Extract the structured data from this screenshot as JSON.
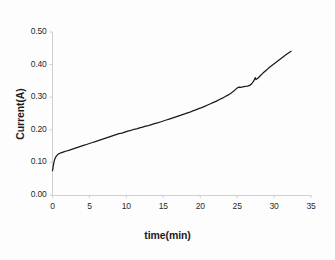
{
  "chart_data": {
    "type": "line",
    "title": "",
    "xlabel": "time(min)",
    "ylabel": "Current(A)",
    "xlim": [
      0,
      35
    ],
    "ylim": [
      0.0,
      0.5
    ],
    "grid": false,
    "legend": null,
    "legend_position": "none",
    "line_color": "#1a1a1a",
    "axis_color": "#c8c8c8",
    "background_color": "#ffffff",
    "xticks": [
      "0",
      "5",
      "10",
      "15",
      "20",
      "25",
      "30",
      "35"
    ],
    "xtick_values": [
      0,
      5,
      10,
      15,
      20,
      25,
      30,
      35
    ],
    "yticks": [
      "0.00",
      "0.10",
      "0.20",
      "0.30",
      "0.40",
      "0.50"
    ],
    "ytick_values": [
      0.0,
      0.1,
      0.2,
      0.3,
      0.4,
      0.5
    ],
    "series": [
      {
        "name": "current",
        "x": [
          0.0,
          0.06,
          0.12,
          0.2,
          0.28,
          0.36,
          0.45,
          0.55,
          0.7,
          0.9,
          1.1,
          1.35,
          1.6,
          1.9,
          2.2,
          2.6,
          3.0,
          3.4,
          3.8,
          4.2,
          4.6,
          5.0,
          5.4,
          5.8,
          6.2,
          6.6,
          7.0,
          7.4,
          7.8,
          8.2,
          8.6,
          9.0,
          9.4,
          9.8,
          10.2,
          10.6,
          11.0,
          11.4,
          11.8,
          12.2,
          12.6,
          13.0,
          13.4,
          13.8,
          14.2,
          14.6,
          15.0,
          15.4,
          15.8,
          16.2,
          16.6,
          17.0,
          17.4,
          17.8,
          18.2,
          18.6,
          19.0,
          19.4,
          19.8,
          20.2,
          20.6,
          21.0,
          21.4,
          21.8,
          22.2,
          22.6,
          23.0,
          23.4,
          23.8,
          24.2,
          24.5,
          24.8,
          25.0,
          25.25,
          25.5,
          25.8,
          26.1,
          26.4,
          26.7,
          27.0,
          27.25,
          27.45,
          27.55,
          27.8,
          28.1,
          28.5,
          28.9,
          29.3,
          29.7,
          30.1,
          30.5,
          30.9,
          31.3,
          31.6,
          31.9,
          32.1,
          32.3
        ],
        "y": [
          0.075,
          0.082,
          0.092,
          0.101,
          0.108,
          0.113,
          0.117,
          0.12,
          0.124,
          0.127,
          0.129,
          0.131,
          0.133,
          0.135,
          0.137,
          0.14,
          0.143,
          0.146,
          0.149,
          0.152,
          0.155,
          0.158,
          0.161,
          0.164,
          0.167,
          0.17,
          0.173,
          0.176,
          0.179,
          0.182,
          0.185,
          0.188,
          0.19,
          0.193,
          0.196,
          0.198,
          0.201,
          0.203,
          0.206,
          0.208,
          0.211,
          0.213,
          0.216,
          0.219,
          0.221,
          0.224,
          0.227,
          0.23,
          0.233,
          0.236,
          0.239,
          0.242,
          0.245,
          0.248,
          0.251,
          0.254,
          0.258,
          0.261,
          0.265,
          0.268,
          0.272,
          0.276,
          0.28,
          0.284,
          0.288,
          0.293,
          0.297,
          0.302,
          0.307,
          0.313,
          0.318,
          0.324,
          0.328,
          0.331,
          0.33,
          0.332,
          0.333,
          0.334,
          0.336,
          0.342,
          0.35,
          0.36,
          0.354,
          0.358,
          0.365,
          0.374,
          0.382,
          0.39,
          0.397,
          0.404,
          0.411,
          0.418,
          0.425,
          0.43,
          0.435,
          0.438,
          0.441
        ]
      }
    ]
  },
  "axes": {
    "y_title": "Current(A)",
    "x_title": "time(min)"
  }
}
